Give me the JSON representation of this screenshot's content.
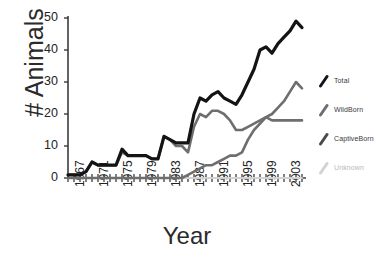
{
  "chart_data": {
    "type": "line",
    "title": "",
    "xlabel": "Year",
    "ylabel": "# Animals",
    "xlim": [
      1967,
      2006
    ],
    "ylim": [
      0,
      50
    ],
    "grid": false,
    "legend_position": "right",
    "ytick_labels": [
      "0",
      "10",
      "20",
      "30",
      "40",
      "50"
    ],
    "ytick_values": [
      0,
      10,
      20,
      30,
      40,
      50
    ],
    "xtick_labels": [
      "1967",
      "1971",
      "1975",
      "1979",
      "1983",
      "1987",
      "1991",
      "1995",
      "1999",
      "2003"
    ],
    "xtick_values": [
      1967,
      1971,
      1975,
      1979,
      1983,
      1987,
      1991,
      1995,
      1999,
      2003
    ],
    "minor_xticks_every": 1,
    "x": [
      1967,
      1968,
      1969,
      1970,
      1971,
      1972,
      1973,
      1974,
      1975,
      1976,
      1977,
      1978,
      1979,
      1980,
      1981,
      1982,
      1983,
      1984,
      1985,
      1986,
      1987,
      1988,
      1989,
      1990,
      1991,
      1992,
      1993,
      1994,
      1995,
      1996,
      1997,
      1998,
      1999,
      2000,
      2001,
      2002,
      2003,
      2004,
      2005,
      2006
    ],
    "series": [
      {
        "name": "Total",
        "color": "#141414",
        "width": 3.2,
        "values": [
          1,
          1,
          1,
          2,
          5,
          4,
          4,
          4,
          4,
          9,
          7,
          7,
          7,
          7,
          6,
          6,
          13,
          12,
          11,
          11,
          11,
          20,
          25,
          24,
          26,
          27,
          25,
          24,
          23,
          26,
          30,
          34,
          40,
          41,
          39,
          42,
          44,
          46,
          49,
          47
        ]
      },
      {
        "name": "WildBorn",
        "color": "#6e6e6e",
        "width": 2.6,
        "values": [
          1,
          1,
          1,
          2,
          5,
          4,
          4,
          4,
          4,
          8,
          7,
          7,
          7,
          7,
          6,
          6,
          13,
          12,
          10,
          10,
          8,
          16,
          20,
          19,
          21,
          21,
          20,
          18,
          15,
          15,
          16,
          17,
          18,
          19,
          18,
          18,
          18,
          18,
          18,
          18
        ]
      },
      {
        "name": "CaptiveBorn",
        "color": "#6e6e6e",
        "width": 2.6,
        "values": [
          0,
          0,
          0,
          0,
          0,
          0,
          0,
          0,
          0,
          0,
          0,
          0,
          0,
          0,
          0,
          0,
          0,
          0,
          0,
          0,
          1,
          2,
          3,
          4,
          4,
          5,
          6,
          7,
          7,
          8,
          12,
          15,
          17,
          19,
          20,
          22,
          24,
          27,
          30,
          28
        ]
      },
      {
        "name": "Unknown",
        "color": "#d2d2d2",
        "width": 2.2,
        "values": [
          0,
          0,
          0,
          0,
          0,
          0,
          0,
          0,
          0,
          0,
          0,
          0,
          0,
          0,
          0,
          0,
          0,
          0,
          0,
          0,
          0,
          0,
          0,
          0,
          0,
          0,
          0,
          0,
          0,
          0,
          0,
          0,
          0,
          0,
          0,
          0,
          0,
          0,
          0,
          0
        ]
      }
    ]
  },
  "legend": {
    "entries": [
      {
        "label": "Total",
        "color": "#141414",
        "dim": false
      },
      {
        "label": "WildBorn",
        "color": "#6e6e6e",
        "dim": false
      },
      {
        "label": "CaptiveBorn",
        "color": "#4a4a4a",
        "dim": false
      },
      {
        "label": "Unknown",
        "color": "#d2d2d2",
        "dim": true
      }
    ]
  }
}
